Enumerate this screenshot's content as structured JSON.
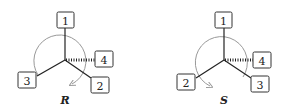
{
  "diagrams": [
    {
      "caption": "R",
      "groups": {
        "top": "1",
        "right": "4",
        "lower_left": "3",
        "lower_right": "2"
      },
      "rotation": "clockwise"
    },
    {
      "caption": "S",
      "groups": {
        "top": "1",
        "right": "4",
        "lower_left": "2",
        "lower_right": "3"
      },
      "rotation": "counterclockwise"
    }
  ],
  "colors": {
    "line": "#222222",
    "arrow": "#999999",
    "box_stroke": "#333333"
  }
}
